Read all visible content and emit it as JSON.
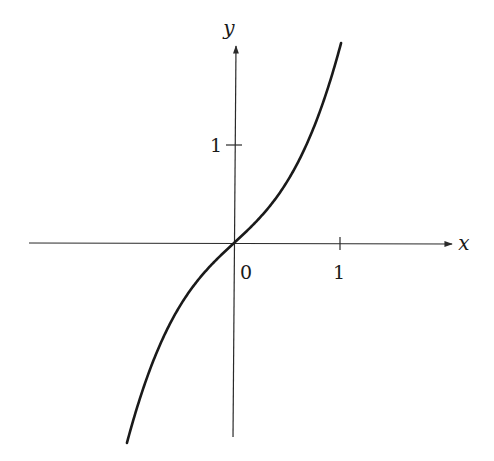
{
  "chart_data": {
    "type": "line",
    "title": "",
    "function": "y = x + x^3",
    "xlabel": "x",
    "ylabel": "y",
    "x_ticks": [
      {
        "value": 1,
        "label": "1"
      }
    ],
    "y_ticks": [
      {
        "value": 1,
        "label": "1"
      }
    ],
    "origin_label": "0",
    "xlim": [
      -2.2,
      2.1
    ],
    "ylim": [
      -1.98,
      2.2
    ],
    "grid": false,
    "series": [
      {
        "name": "curve",
        "x": [
          -1.0,
          -0.75,
          -0.5,
          -0.25,
          0,
          0.25,
          0.5,
          0.75,
          1.0
        ],
        "y": [
          -2.0,
          -1.17,
          -0.625,
          -0.266,
          0,
          0.266,
          0.625,
          1.17,
          2.0
        ]
      }
    ]
  },
  "labels": {
    "x_axis": "x",
    "y_axis": "y",
    "origin": "0",
    "x_tick_1": "1",
    "y_tick_1": "1"
  },
  "colors": {
    "axis": "#2a2a2a",
    "curve": "#1a1a1a",
    "background": "#ffffff"
  }
}
